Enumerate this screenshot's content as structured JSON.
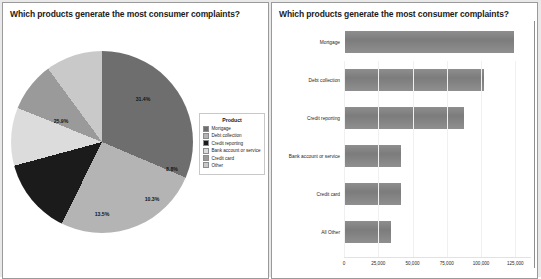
{
  "dashboard": {
    "left_panel": {
      "title": "Which products generate the most consumer complaints?"
    },
    "right_panel": {
      "title": "Which products generate the most consumer complaints?"
    }
  },
  "legend": {
    "title": "Product",
    "items": [
      {
        "label": "Mortgage",
        "color": "#6e6e6e"
      },
      {
        "label": "Debt collection",
        "color": "#b4b4b4"
      },
      {
        "label": "Credit reporting",
        "color": "#1b1b1b"
      },
      {
        "label": "Bank account or service",
        "color": "#dcdcdc"
      },
      {
        "label": "Credit card",
        "color": "#9a9a9a"
      },
      {
        "label": "Other",
        "color": "#c9c9c9"
      }
    ]
  },
  "chart_data": [
    {
      "type": "pie",
      "title": "Which products generate the most consumer complaints?",
      "categories": [
        "Mortgage",
        "Debt collection",
        "Credit reporting",
        "Bank account or service",
        "Credit card",
        "Other"
      ],
      "values": [
        31.4,
        25.9,
        13.5,
        10.3,
        8.8,
        10.1
      ],
      "labels": [
        "31.4%",
        "25.9%",
        "13.5%",
        "10.3%",
        "8.8%",
        ""
      ],
      "colors": [
        "#6e6e6e",
        "#b4b4b4",
        "#1b1b1b",
        "#dcdcdc",
        "#9a9a9a",
        "#c9c9c9"
      ],
      "legend_position": "right",
      "legend_title": "Product"
    },
    {
      "type": "bar",
      "orientation": "horizontal",
      "title": "Which products generate the most consumer complaints?",
      "categories": [
        "Mortgage",
        "Debt collection",
        "Credit reporting",
        "Bank account or service",
        "Credit card",
        "All Other"
      ],
      "values": [
        125000,
        103000,
        88000,
        42000,
        42000,
        35000
      ],
      "xlabel": "",
      "ylabel": "",
      "xlim": [
        0,
        135000
      ],
      "xticks": [
        0,
        25000,
        50000,
        75000,
        100000,
        125000
      ],
      "xticklabels": [
        "0",
        "25,000",
        "50,000",
        "75,000",
        "100,000",
        "125,000"
      ],
      "grid": true,
      "bar_color": "#838383"
    }
  ],
  "pie_labels": {
    "mortgage": "31.4%",
    "debt_collection": "25.9%",
    "credit_reporting": "13.5%",
    "bank_account": "10.3%",
    "credit_card": "8.8%"
  },
  "bars": [
    {
      "category": "Mortgage",
      "value": 125000
    },
    {
      "category": "Debt collection",
      "value": 103000
    },
    {
      "category": "Credit reporting",
      "value": 88000
    },
    {
      "category": "Bank account or service",
      "value": 42000
    },
    {
      "category": "Credit card",
      "value": 42000
    },
    {
      "category": "All Other",
      "value": 35000
    }
  ],
  "xticklabels": [
    "0",
    "25,000",
    "50,000",
    "75,000",
    "100,000",
    "125,000"
  ]
}
